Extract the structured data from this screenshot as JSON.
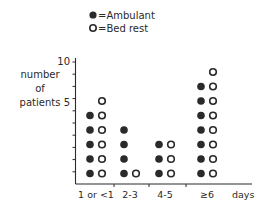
{
  "chart_data": {
    "type": "scatter",
    "subtype": "dot-count-column",
    "title": "",
    "xlabel": "days",
    "ylabel": "number of patients",
    "ylabel_lines": [
      "number",
      "of",
      "patients"
    ],
    "categories": [
      "1 or <1",
      "2-3",
      "4-5",
      "≥6"
    ],
    "series": [
      {
        "name": "Ambulant",
        "marker": "filled-circle",
        "values": [
          5,
          4,
          3,
          7
        ]
      },
      {
        "name": "Bed rest",
        "marker": "open-circle",
        "values": [
          6,
          1,
          3,
          8
        ]
      }
    ],
    "ylim": [
      0,
      10
    ],
    "yticks": [
      5,
      10
    ],
    "minor_ytick_step": 1,
    "grid": false,
    "legend": {
      "position": "top",
      "entries": [
        "=Ambulant",
        "=Bed rest"
      ]
    }
  },
  "axis": {
    "y_tick_5": "5",
    "y_tick_10": "10",
    "x_unit": "days"
  },
  "colors": {
    "ink": "#2a2a2a",
    "background": "#ffffff"
  }
}
